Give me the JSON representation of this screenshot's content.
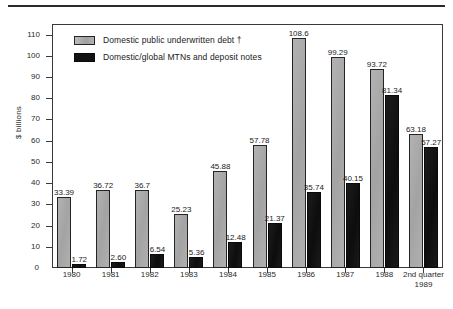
{
  "chart_data": {
    "type": "bar",
    "title": "",
    "xlabel": "",
    "ylabel": "$ billions",
    "ylim": [
      0,
      115
    ],
    "yticks": [
      0,
      10,
      20,
      30,
      40,
      50,
      60,
      70,
      80,
      90,
      100,
      110
    ],
    "grid": false,
    "legend_position": "upper-left-inside",
    "categories": [
      "1980",
      "1981",
      "1982",
      "1983",
      "1984",
      "1985",
      "1986",
      "1987",
      "1988",
      "2nd quarter 1989"
    ],
    "series": [
      {
        "name": "Domestic public underwritten debt †",
        "color": "#a9a9a9",
        "values": [
          33.39,
          36.72,
          36.7,
          25.23,
          45.88,
          57.78,
          108.6,
          99.29,
          93.72,
          63.18
        ],
        "value_labels": [
          "33.39",
          "36.72",
          "36.7",
          "25.23",
          "45.88",
          "57.78",
          "108.6",
          "99.29",
          "93.72",
          "63.18"
        ]
      },
      {
        "name": "Domestic/global MTNs and deposit notes",
        "color": "#121212",
        "values": [
          1.72,
          2.6,
          6.54,
          5.36,
          12.48,
          21.37,
          35.74,
          40.15,
          81.34,
          57.27
        ],
        "value_labels": [
          "1.72",
          "2.60",
          "6.54",
          "5.36",
          "12.48",
          "21.37",
          "35.74",
          "40.15",
          "81.34",
          "57.27"
        ]
      }
    ]
  },
  "axis": {
    "y_title": "$ billions",
    "y_tick_labels": [
      "110",
      "100",
      "90",
      "80",
      "70",
      "60",
      "50",
      "40",
      "30",
      "20",
      "10",
      "0"
    ],
    "x_tick_labels": [
      {
        "line1": "1980",
        "line2": ""
      },
      {
        "line1": "1981",
        "line2": ""
      },
      {
        "line1": "1982",
        "line2": ""
      },
      {
        "line1": "1983",
        "line2": ""
      },
      {
        "line1": "1984",
        "line2": ""
      },
      {
        "line1": "1985",
        "line2": ""
      },
      {
        "line1": "1986",
        "line2": ""
      },
      {
        "line1": "1987",
        "line2": ""
      },
      {
        "line1": "1988",
        "line2": ""
      },
      {
        "line1": "2nd quarter",
        "line2": "1989"
      }
    ]
  },
  "legend": {
    "items": [
      {
        "label": "Domestic public underwritten debt †",
        "swatch": "gray"
      },
      {
        "label": "Domestic/global MTNs and deposit notes",
        "swatch": "black"
      }
    ]
  }
}
